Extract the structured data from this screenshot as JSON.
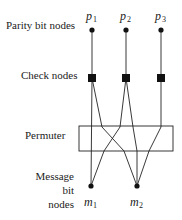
{
  "diagram": {
    "labels": {
      "parity": "Parity bit nodes",
      "check": "Check nodes",
      "permuter": "Permuter",
      "message_line1": "Message",
      "message_line2": "bit",
      "message_line3": "nodes"
    },
    "parity_nodes": [
      {
        "name": "p",
        "sub": "1"
      },
      {
        "name": "p",
        "sub": "2"
      },
      {
        "name": "p",
        "sub": "3"
      }
    ],
    "message_nodes": [
      {
        "name": "m",
        "sub": "1"
      },
      {
        "name": "m",
        "sub": "2"
      }
    ],
    "colors": {
      "stroke": "#222222",
      "node": "#111111"
    }
  }
}
